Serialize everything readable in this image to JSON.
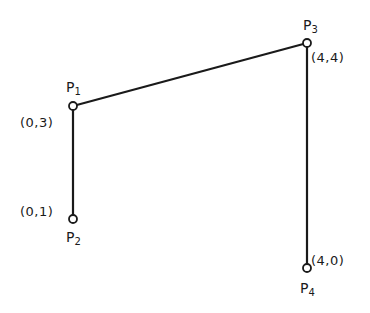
{
  "diagram": {
    "line_color": "#1a1a1a",
    "point_fill": "#ffffff",
    "points": [
      {
        "id": "P1",
        "name": "P",
        "sub": "1",
        "coord": "(0,3)",
        "x": 73,
        "y": 106
      },
      {
        "id": "P2",
        "name": "P",
        "sub": "2",
        "coord": "(0,1)",
        "x": 73,
        "y": 219
      },
      {
        "id": "P3",
        "name": "P",
        "sub": "3",
        "coord": "(4,4)",
        "x": 307,
        "y": 43
      },
      {
        "id": "P4",
        "name": "P",
        "sub": "4",
        "coord": "(4,0)",
        "x": 307,
        "y": 268
      }
    ],
    "segments": [
      {
        "from": "P2",
        "to": "P1"
      },
      {
        "from": "P1",
        "to": "P3"
      },
      {
        "from": "P3",
        "to": "P4"
      }
    ]
  }
}
